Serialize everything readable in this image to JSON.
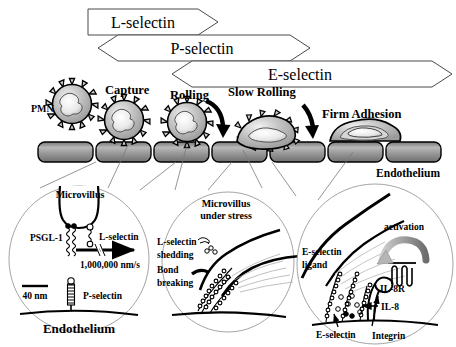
{
  "figure": {
    "selectin_bars": [
      {
        "name": "L-selectin",
        "label": "L-selectin",
        "shape": "flag-right-point"
      },
      {
        "name": "P-selectin",
        "label": "P-selectin",
        "shape": "hexagon-double-point"
      },
      {
        "name": "E-selectin",
        "label": "E-selectin",
        "shape": "hexagon-double-point"
      }
    ],
    "steps": [
      {
        "name": "capture",
        "label": "Capture"
      },
      {
        "name": "rolling",
        "label": "Rolling"
      },
      {
        "name": "slow-rolling",
        "label": "Slow Rolling"
      },
      {
        "name": "firm-adhesion",
        "label": "Firm Adhesion"
      }
    ],
    "cell_label": "PMN",
    "vessel_label": "Endothelium",
    "insets": [
      {
        "name": "capture-inset",
        "labels": [
          "Microvillus",
          "PSGL-1",
          "L-selectin",
          "1,000,000 nm/s",
          "40 nm",
          "P-selectin",
          "Endothelium"
        ]
      },
      {
        "name": "rolling-inset",
        "labels": [
          "Microvillus",
          "under stress",
          "L-selectin",
          "shedding",
          "Bond",
          "breaking"
        ]
      },
      {
        "name": "firm-adhesion-inset",
        "labels": [
          "activation",
          "E-selectin",
          "ligand",
          "IL-8R",
          "IL-8",
          "E-selectin",
          "Integrin"
        ]
      }
    ]
  },
  "inset1": {
    "microvillus": "Microvillus",
    "psgl1": "PSGL-1",
    "lselectin": "L-selectin",
    "speed": "1,000,000 nm/s",
    "scale": "40 nm",
    "pselectin": "P-selectin",
    "endothelium": "Endothelium"
  },
  "inset2": {
    "microvillus_l1": "Microvillus",
    "microvillus_l2": "under stress",
    "shedding_l1": "L-selectin",
    "shedding_l2": "shedding",
    "bond_l1": "Bond",
    "bond_l2": "breaking"
  },
  "inset3": {
    "activation": "activation",
    "ligand_l1": "E-selectin",
    "ligand_l2": "ligand",
    "il8r": "IL-8R",
    "il8": "IL-8",
    "eselectin": "E-selectin",
    "integrin": "Integrin"
  },
  "colors": {
    "ink": "#000000",
    "cell_fill": "#c9c9c9",
    "cell_fill_light": "#e2e2e2",
    "endo_fill": "#8e8e8e",
    "endo_fill_light": "#b8b8b8",
    "thin_line": "#8a8a8a",
    "arrow_gray": "#9a9a9a",
    "background": "#ffffff"
  }
}
